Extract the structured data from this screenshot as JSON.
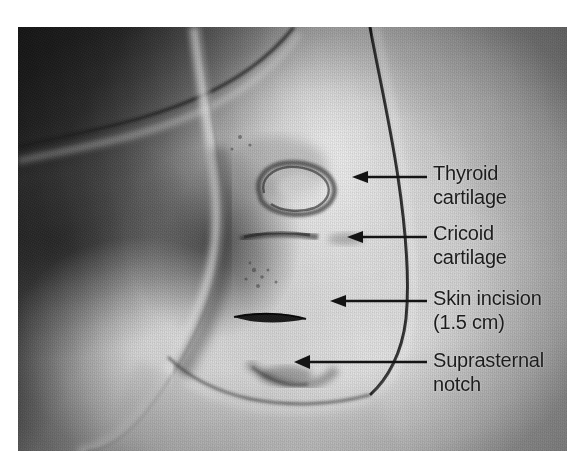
{
  "figure": {
    "kind": "clinical-photograph",
    "modality": "color-photograph-grayscale",
    "background_color": "#ffffff",
    "arrow_color": "#141414",
    "text_color": "#1c1c1c"
  },
  "photo": {
    "left": 18,
    "top": 27,
    "width": 549,
    "height": 424,
    "description": "Grayscale intraoperative photograph of a patient's anterior neck surrounded by surgical drapes. The head is extended; surface landmarks are marked on the skin and a short transverse skin incision has been made."
  },
  "annotations": [
    {
      "id": "thyroid-cartilage",
      "label": "Thyroid\ncartilage",
      "label_line1": "Thyroid",
      "label_line2": "cartilage",
      "arrow": {
        "x1": 427,
        "y1": 177,
        "x2": 352,
        "y2": 177
      },
      "target": "Thyroid cartilage prominence marked on skin"
    },
    {
      "id": "cricoid-cartilage",
      "label": "Cricoid\ncartilage",
      "label_line1": "Cricoid",
      "label_line2": "cartilage",
      "arrow": {
        "x1": 427,
        "y1": 237,
        "x2": 347,
        "y2": 237
      },
      "target": "Cricoid cartilage marked on skin"
    },
    {
      "id": "skin-incision",
      "label": "Skin incision\n(1.5 cm)",
      "label_line1": "Skin incision",
      "label_line2": "(1.5 cm)",
      "arrow": {
        "x1": 427,
        "y1": 301,
        "x2": 330,
        "y2": 301
      },
      "target": "Transverse skin incision",
      "measurement": "1.5 cm"
    },
    {
      "id": "suprasternal-notch",
      "label": "Suprasternal\nnotch",
      "label_line1": "Suprasternal",
      "label_line2": "notch",
      "arrow": {
        "x1": 427,
        "y1": 362,
        "x2": 294,
        "y2": 362
      },
      "target": "Suprasternal notch"
    }
  ]
}
